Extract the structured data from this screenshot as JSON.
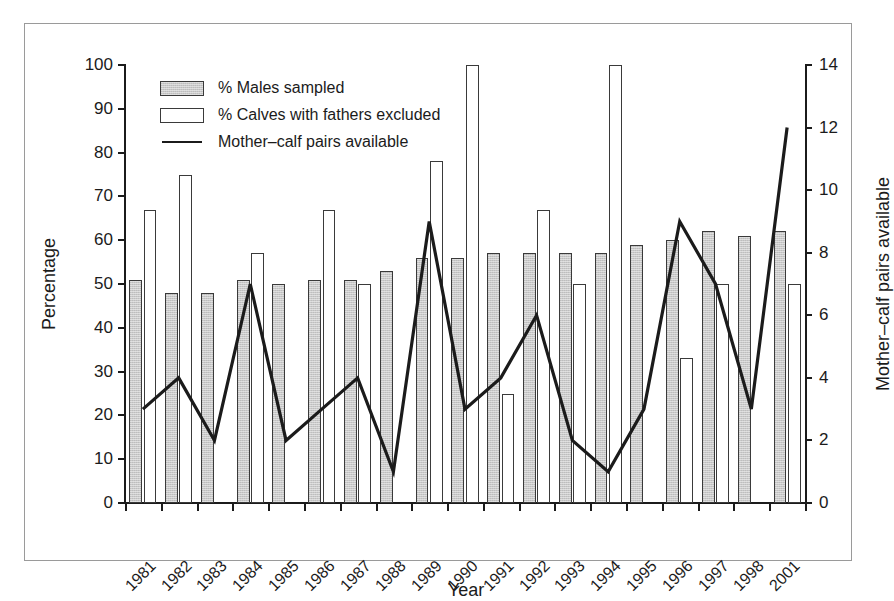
{
  "chart_data": {
    "type": "bar",
    "title": "",
    "subtitle": "",
    "xlabel": "Year",
    "ylabel": "Percentage",
    "y2label": "Mother–calf pairs available",
    "ylim": [
      0,
      100
    ],
    "y2lim": [
      0,
      14
    ],
    "grid": false,
    "legend_position": "top-left",
    "categories": [
      "1981",
      "1982",
      "1983",
      "1984",
      "1985",
      "1986",
      "1987",
      "1988",
      "1989",
      "1990",
      "1991",
      "1992",
      "1993",
      "1994",
      "1995",
      "1996",
      "1997",
      "1998",
      "2001"
    ],
    "yticks": [
      "0",
      "10",
      "20",
      "30",
      "40",
      "50",
      "60",
      "70",
      "80",
      "90",
      "100"
    ],
    "y2ticks": [
      "0",
      "2",
      "4",
      "6",
      "8",
      "10",
      "12",
      "14"
    ],
    "series": [
      {
        "name": "% Males sampled",
        "kind": "bar",
        "style": "gray-hatched",
        "axis": "left",
        "values": [
          51,
          48,
          48,
          51,
          50,
          51,
          51,
          53,
          56,
          56,
          57,
          57,
          57,
          57,
          59,
          60,
          62,
          61,
          62
        ]
      },
      {
        "name": "% Calves with fathers excluded",
        "kind": "bar",
        "style": "white-outline",
        "axis": "left",
        "values": [
          67,
          75,
          null,
          57,
          null,
          67,
          50,
          null,
          78,
          100,
          25,
          67,
          50,
          100,
          null,
          33,
          50,
          null,
          50
        ]
      },
      {
        "name": "Mother–calf pairs available",
        "kind": "line",
        "style": "solid-black",
        "axis": "right",
        "values": [
          3,
          4,
          2,
          7,
          2,
          3,
          4,
          1,
          9,
          3,
          4,
          6,
          2,
          1,
          3,
          9,
          7,
          3,
          12
        ]
      }
    ]
  },
  "legend": {
    "items": [
      {
        "label": "% Males sampled",
        "key": "gray-swatch"
      },
      {
        "label": "% Calves with fathers excluded",
        "key": "white-swatch"
      },
      {
        "label": "Mother–calf pairs available",
        "key": "line-swatch"
      }
    ]
  },
  "axes": {
    "left_title": "Percentage",
    "right_title": "Mother–calf pairs available",
    "bottom_title": "Year"
  },
  "colors": {
    "bar_gray_fill": "#c9c9c9",
    "bar_outline": "#3a3a3a",
    "line": "#1b1b1b",
    "axis": "#1b1b1b",
    "frame": "#9a9a9a",
    "background": "#ffffff"
  }
}
